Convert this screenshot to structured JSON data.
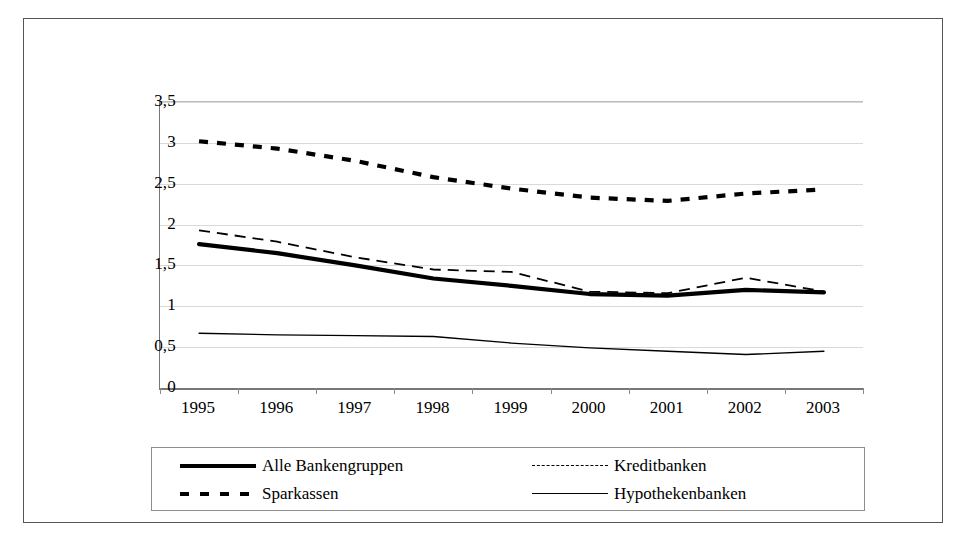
{
  "chart_data": {
    "type": "line",
    "title": "",
    "subtitle": "",
    "xlabel": "",
    "ylabel": "",
    "categories": [
      "1995",
      "1996",
      "1997",
      "1998",
      "1999",
      "2000",
      "2001",
      "2002",
      "2003"
    ],
    "ylim": [
      0,
      3.5
    ],
    "ytick_labels": [
      "0",
      "0,5",
      "1",
      "1,5",
      "2",
      "2,5",
      "3",
      "3,5"
    ],
    "ytick_values": [
      0,
      0.5,
      1,
      1.5,
      2,
      2.5,
      3,
      3.5
    ],
    "grid": true,
    "legend_position": "bottom",
    "series": [
      {
        "name": "Alle Bankengruppen",
        "style": "thick-solid",
        "values": [
          1.76,
          1.65,
          1.5,
          1.34,
          1.25,
          1.15,
          1.13,
          1.2,
          1.17
        ]
      },
      {
        "name": "Kreditbanken",
        "style": "long-dash",
        "values": [
          1.93,
          1.79,
          1.6,
          1.45,
          1.42,
          1.18,
          1.16,
          1.35,
          1.18
        ]
      },
      {
        "name": "Sparkassen",
        "style": "square-dot",
        "values": [
          3.02,
          2.93,
          2.78,
          2.58,
          2.44,
          2.33,
          2.29,
          2.38,
          2.43
        ]
      },
      {
        "name": "Hypothekenbanken",
        "style": "thin-solid",
        "values": [
          0.67,
          0.65,
          0.64,
          0.63,
          0.55,
          0.49,
          0.45,
          0.41,
          0.45
        ]
      }
    ]
  },
  "legend": {
    "items": [
      {
        "label": "Alle Bankengruppen",
        "style": "thick-solid"
      },
      {
        "label": "Kreditbanken",
        "style": "long-dash"
      },
      {
        "label": "Sparkassen",
        "style": "square-dot"
      },
      {
        "label": "Hypothekenbanken",
        "style": "thin-solid"
      }
    ]
  },
  "colors": {
    "series": "#000000",
    "grid": "#d9d9d9",
    "axis": "#777777",
    "frame": "#555555",
    "background": "#ffffff"
  }
}
